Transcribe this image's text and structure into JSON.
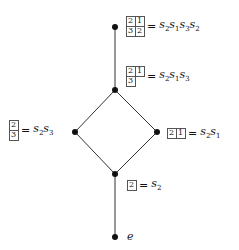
{
  "diagram": {
    "type": "hasse-diagram",
    "nodes": [
      {
        "id": "n0",
        "x": 115,
        "y": 27,
        "tableau": [
          [
            "2",
            "1"
          ],
          [
            "3",
            "2"
          ]
        ],
        "word": [
          "2",
          "1",
          "3",
          "2"
        ]
      },
      {
        "id": "n1",
        "x": 115,
        "y": 90,
        "tableau": [
          [
            "2",
            "1"
          ],
          [
            "3",
            ""
          ]
        ],
        "word": [
          "2",
          "1",
          "3"
        ]
      },
      {
        "id": "n2",
        "x": 75,
        "y": 132,
        "tableau": [
          [
            "2"
          ],
          [
            "3"
          ]
        ],
        "word": [
          "2",
          "3"
        ]
      },
      {
        "id": "n3",
        "x": 157,
        "y": 132,
        "tableau": [
          [
            "2",
            "1"
          ]
        ],
        "word": [
          "2",
          "1"
        ]
      },
      {
        "id": "n4",
        "x": 115,
        "y": 174,
        "tableau": [
          [
            "2"
          ]
        ],
        "word": [
          "2"
        ]
      },
      {
        "id": "n5",
        "x": 115,
        "y": 237,
        "identity": "e"
      }
    ],
    "edges": [
      [
        "n0",
        "n1"
      ],
      [
        "n1",
        "n2"
      ],
      [
        "n1",
        "n3"
      ],
      [
        "n2",
        "n4"
      ],
      [
        "n3",
        "n4"
      ],
      [
        "n4",
        "n5"
      ]
    ],
    "labels": {
      "n0": {
        "cells": [
          "2",
          "1",
          "3",
          "2"
        ],
        "eq": "=",
        "word_text": "s2s1s3s2"
      },
      "n1": {
        "cells": [
          "2",
          "1",
          "3"
        ],
        "eq": "=",
        "word_text": "s2s1s3"
      },
      "n2": {
        "cells": [
          "2",
          "3"
        ],
        "eq": "=",
        "word_text": "s2s3"
      },
      "n3": {
        "cells": [
          "2",
          "1"
        ],
        "eq": "=",
        "word_text": "s2s1"
      },
      "n4": {
        "cells": [
          "2"
        ],
        "eq": "=",
        "word_text": "s2"
      },
      "n5": {
        "text": "e"
      }
    }
  }
}
